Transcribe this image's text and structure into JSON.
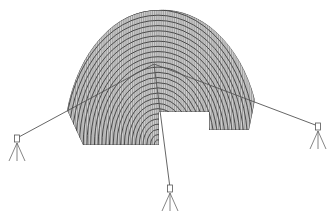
{
  "diagram": {
    "type": "survey-scan-mesh",
    "mesh": {
      "center": [
        158,
        145
      ],
      "outer_radius": 135,
      "ring_count": 26,
      "radial_count": 90,
      "left_bottom_y": 145,
      "right_bottom_y": 130,
      "notch": {
        "x1": 159,
        "x2": 209,
        "top_y": 112
      },
      "color": "#333333"
    },
    "target_point": [
      154,
      64
    ],
    "instruments": [
      {
        "name": "left-tripod",
        "head": [
          17,
          138
        ]
      },
      {
        "name": "center-tripod",
        "head": [
          170,
          188
        ]
      },
      {
        "name": "right-tripod",
        "head": [
          318,
          126
        ]
      }
    ],
    "line_color": "#555555"
  }
}
